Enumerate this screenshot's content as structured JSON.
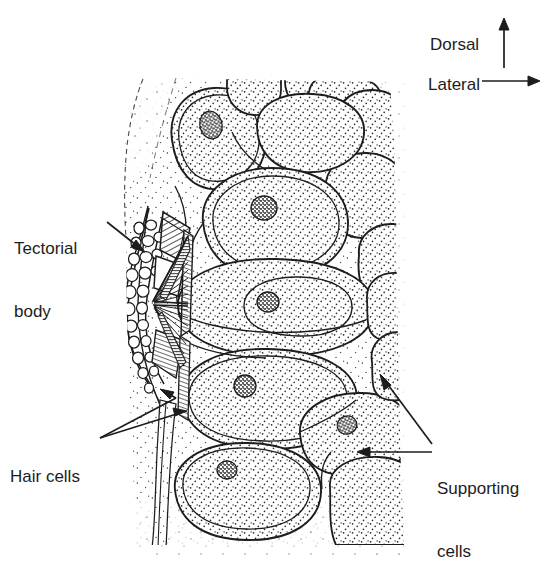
{
  "figure": {
    "kind": "anatomical-line-drawing",
    "background_color": "#ffffff",
    "ink_color": "#1d1d1d",
    "stipple_color": "#2a2a2a"
  },
  "labels": {
    "tectorial_body": {
      "line1": "Tectorial",
      "line2": "body"
    },
    "hair_cells": {
      "line1": "Hair cells"
    },
    "supporting_cells": {
      "line1": "Supporting",
      "line2": "cells"
    }
  },
  "orientation_key": {
    "dorsal": {
      "label": "Dorsal",
      "icon": "arrow-up-icon",
      "direction": "up"
    },
    "lateral": {
      "label": "Lateral",
      "icon": "arrow-right-icon",
      "direction": "right"
    }
  },
  "structures": {
    "tectorial_body": {
      "name": "tectorial-body",
      "description": "Vesiculated cupula-like mass at the medial edge with hatched wedge-shaped lamellae"
    },
    "hair_cells": {
      "name": "hair-cells",
      "description": "Radiating striated fibres converging toward the tectorial body"
    },
    "supporting_cells": {
      "name": "supporting-cells",
      "description": "Large stippled cells with dark stippled nuclei filling the epithelium"
    },
    "basal_strip": {
      "name": "basal-strip",
      "description": "Narrow stippled band running down the medial border beneath the hair cells"
    }
  }
}
